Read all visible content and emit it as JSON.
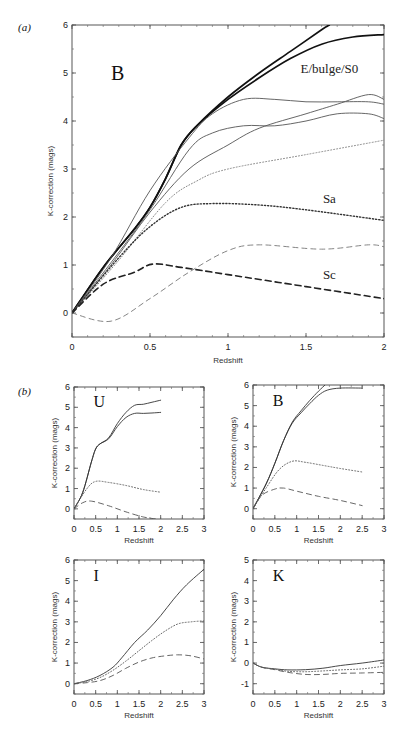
{
  "figure": {
    "panel_a_label": "(a)",
    "panel_b_label": "(b)"
  },
  "chart_data": [
    {
      "type": "line",
      "panel": "(a)",
      "band": "B",
      "xlabel": "Redshift",
      "ylabel": "K-correction (mags)",
      "xlim": [
        0,
        2
      ],
      "ylim": [
        -0.5,
        6
      ],
      "xticks": [
        "0",
        "0.5",
        "1",
        "1.5",
        "2"
      ],
      "yticks": [
        "0",
        "1",
        "2",
        "3",
        "4",
        "5",
        "6"
      ],
      "annotations": [
        "E/bulge/S0",
        "Sa",
        "Sc"
      ],
      "series": [
        {
          "name": "E/bulge/S0 (1)",
          "style": "thick-solid",
          "x": [
            0,
            0.2,
            0.4,
            0.5,
            0.6,
            0.7,
            0.8,
            1.0,
            1.2,
            1.4,
            1.6,
            1.65
          ],
          "y": [
            0,
            0.95,
            1.75,
            2.2,
            2.8,
            3.5,
            3.9,
            4.5,
            5.0,
            5.45,
            5.9,
            6.0
          ]
        },
        {
          "name": "E/bulge/S0 (2)",
          "style": "thick-solid",
          "x": [
            0,
            0.2,
            0.4,
            0.5,
            0.6,
            0.7,
            0.8,
            1.0,
            1.2,
            1.4,
            1.6,
            1.8,
            2.0
          ],
          "y": [
            0,
            0.95,
            1.75,
            2.2,
            2.8,
            3.5,
            3.9,
            4.45,
            4.9,
            5.3,
            5.6,
            5.75,
            5.8
          ]
        },
        {
          "name": "thin solid A",
          "style": "thin-solid",
          "x": [
            0,
            0.25,
            0.5,
            0.75,
            0.9,
            1.1,
            1.3,
            1.5,
            1.7,
            1.9,
            2.0
          ],
          "y": [
            0,
            1.15,
            2.55,
            3.65,
            4.15,
            4.45,
            4.45,
            4.4,
            4.4,
            4.4,
            4.35
          ]
        },
        {
          "name": "thin solid B",
          "style": "thin-solid",
          "x": [
            0,
            0.25,
            0.5,
            0.75,
            0.9,
            1.1,
            1.3,
            1.5,
            1.7,
            1.9,
            2.0
          ],
          "y": [
            0,
            1.05,
            2.15,
            3.4,
            3.75,
            3.9,
            3.9,
            4.0,
            4.15,
            4.15,
            4.05
          ]
        },
        {
          "name": "thin solid C",
          "style": "thin-solid",
          "x": [
            0,
            0.25,
            0.5,
            0.75,
            1.0,
            1.2,
            1.5,
            1.7,
            1.9,
            2.0
          ],
          "y": [
            0,
            1.0,
            2.1,
            3.0,
            3.5,
            3.85,
            4.15,
            4.35,
            4.55,
            4.45
          ]
        },
        {
          "name": "Sa (1)",
          "style": "light-dotted",
          "x": [
            0,
            0.3,
            0.6,
            0.8,
            1.0,
            1.5,
            2.0
          ],
          "y": [
            0,
            1.1,
            2.3,
            2.75,
            3.0,
            3.3,
            3.6
          ]
        },
        {
          "name": "Sa (2)",
          "style": "dark-dotted",
          "x": [
            0,
            0.3,
            0.5,
            0.7,
            0.9,
            1.2,
            1.5,
            2.0
          ],
          "y": [
            0,
            1.15,
            1.8,
            2.2,
            2.28,
            2.25,
            2.15,
            1.93
          ]
        },
        {
          "name": "Sc (1)",
          "style": "thick-dashed",
          "x": [
            0,
            0.2,
            0.4,
            0.52,
            0.7,
            1.0,
            1.5,
            2.0
          ],
          "y": [
            0,
            0.6,
            0.85,
            1.02,
            0.95,
            0.8,
            0.55,
            0.3
          ]
        },
        {
          "name": "Sc (2)",
          "style": "thin-dashed",
          "x": [
            0,
            0.25,
            0.5,
            0.75,
            1.0,
            1.2,
            1.6,
            1.9,
            2.0
          ],
          "y": [
            0,
            -0.17,
            0.3,
            0.85,
            1.3,
            1.42,
            1.33,
            1.42,
            1.38
          ]
        }
      ]
    },
    {
      "type": "line",
      "panel": "(b)",
      "band": "U",
      "xlabel": "Redshift",
      "ylabel": "K-correction (mags)",
      "xlim": [
        0,
        3
      ],
      "ylim": [
        -0.5,
        6
      ],
      "xticks": [
        "0",
        "0.5",
        "1",
        "1.5",
        "2",
        "2.5",
        "3"
      ],
      "yticks": [
        "0",
        "1",
        "2",
        "3",
        "4",
        "5",
        "6"
      ],
      "series": [
        {
          "name": "E (1)",
          "style": "solid",
          "x": [
            0,
            0.2,
            0.4,
            0.5,
            0.6,
            0.8,
            1.0,
            1.2,
            1.4,
            1.6,
            1.8,
            2.0
          ],
          "y": [
            0,
            0.8,
            2.3,
            2.95,
            3.2,
            3.5,
            4.2,
            4.75,
            5.1,
            5.15,
            5.25,
            5.35
          ]
        },
        {
          "name": "E (2)",
          "style": "solid",
          "x": [
            0,
            0.2,
            0.4,
            0.5,
            0.6,
            0.8,
            1.0,
            1.2,
            1.4,
            1.6,
            1.8,
            2.0
          ],
          "y": [
            0,
            0.8,
            2.3,
            2.95,
            3.2,
            3.45,
            4.05,
            4.5,
            4.7,
            4.7,
            4.72,
            4.75
          ]
        },
        {
          "name": "Sa",
          "style": "dotted",
          "x": [
            0,
            0.3,
            0.5,
            0.8,
            1.2,
            1.6,
            2.0
          ],
          "y": [
            0,
            1.0,
            1.35,
            1.3,
            1.15,
            0.95,
            0.82
          ]
        },
        {
          "name": "Sc",
          "style": "dashed",
          "x": [
            0,
            0.2,
            0.4,
            0.8,
            1.2,
            1.6,
            1.9
          ],
          "y": [
            0,
            0.3,
            0.38,
            0.15,
            -0.15,
            -0.4,
            -0.5
          ]
        }
      ]
    },
    {
      "type": "line",
      "panel": "(b)",
      "band": "B",
      "xlabel": "Redshift",
      "ylabel": "K-correction (mags)",
      "xlim": [
        0,
        3
      ],
      "ylim": [
        -0.5,
        6
      ],
      "xticks": [
        "0",
        "0.5",
        "1",
        "1.5",
        "2",
        "2.5",
        "3"
      ],
      "yticks": [
        "0",
        "1",
        "2",
        "3",
        "4",
        "5",
        "6"
      ],
      "series": [
        {
          "name": "E (1)",
          "style": "solid",
          "x": [
            0,
            0.3,
            0.5,
            0.7,
            0.9,
            1.1,
            1.3,
            1.5,
            1.65
          ],
          "y": [
            0,
            1.2,
            2.2,
            3.3,
            4.2,
            4.75,
            5.25,
            5.7,
            6.0
          ]
        },
        {
          "name": "E (2)",
          "style": "solid",
          "x": [
            0,
            0.3,
            0.5,
            0.7,
            0.9,
            1.1,
            1.3,
            1.5,
            1.7,
            2.0,
            2.5
          ],
          "y": [
            0,
            1.2,
            2.2,
            3.3,
            4.15,
            4.65,
            5.1,
            5.5,
            5.75,
            5.85,
            5.85
          ]
        },
        {
          "name": "Sa",
          "style": "dotted",
          "x": [
            0,
            0.3,
            0.6,
            0.9,
            1.2,
            1.6,
            2.0,
            2.5
          ],
          "y": [
            0,
            1.0,
            1.9,
            2.3,
            2.25,
            2.1,
            1.95,
            1.78
          ]
        },
        {
          "name": "Sc",
          "style": "dashed",
          "x": [
            0,
            0.2,
            0.5,
            0.7,
            1.0,
            1.5,
            2.0,
            2.5
          ],
          "y": [
            0,
            0.65,
            0.95,
            1.0,
            0.85,
            0.6,
            0.4,
            0.15
          ]
        }
      ]
    },
    {
      "type": "line",
      "panel": "(b)",
      "band": "I",
      "xlabel": "Redshift",
      "ylabel": "K-correction (mags)",
      "xlim": [
        0,
        3
      ],
      "ylim": [
        -0.5,
        6
      ],
      "xticks": [
        "0",
        "0.5",
        "1",
        "1.5",
        "2",
        "2.5",
        "3"
      ],
      "yticks": [
        "0",
        "1",
        "2",
        "3",
        "4",
        "5",
        "6"
      ],
      "series": [
        {
          "name": "E",
          "style": "solid",
          "x": [
            0,
            0.3,
            0.6,
            0.9,
            1.1,
            1.4,
            1.7,
            2.0,
            2.3,
            2.6,
            3.0
          ],
          "y": [
            0,
            0.15,
            0.4,
            0.8,
            1.25,
            2.0,
            2.6,
            3.3,
            4.1,
            4.8,
            5.55
          ]
        },
        {
          "name": "Sa",
          "style": "dotted",
          "x": [
            0,
            0.3,
            0.6,
            0.9,
            1.2,
            1.5,
            1.8,
            2.1,
            2.4,
            2.7,
            3.0
          ],
          "y": [
            0,
            0.1,
            0.3,
            0.65,
            1.1,
            1.6,
            2.1,
            2.55,
            2.9,
            3.0,
            3.05
          ]
        },
        {
          "name": "Sc",
          "style": "dashed",
          "x": [
            0,
            0.3,
            0.6,
            0.9,
            1.2,
            1.5,
            1.8,
            2.1,
            2.4,
            2.7,
            3.0
          ],
          "y": [
            0,
            0.05,
            0.15,
            0.4,
            0.75,
            1.05,
            1.25,
            1.35,
            1.4,
            1.35,
            1.2
          ]
        }
      ]
    },
    {
      "type": "line",
      "panel": "(b)",
      "band": "K",
      "xlabel": "Redshift",
      "ylabel": "K-correction (mags)",
      "xlim": [
        0,
        3
      ],
      "ylim": [
        -1.5,
        5
      ],
      "xticks": [
        "0",
        "0.5",
        "1",
        "1.5",
        "2",
        "2.5",
        "3"
      ],
      "yticks": [
        "-1",
        "0",
        "1",
        "2",
        "3",
        "4",
        "5"
      ],
      "series": [
        {
          "name": "E",
          "style": "solid",
          "x": [
            0,
            0.2,
            0.5,
            0.8,
            1.2,
            1.6,
            2.0,
            2.5,
            3.0
          ],
          "y": [
            0,
            -0.2,
            -0.28,
            -0.33,
            -0.32,
            -0.25,
            -0.12,
            0.0,
            0.15
          ]
        },
        {
          "name": "Sa",
          "style": "dotted",
          "x": [
            0,
            0.2,
            0.5,
            0.8,
            1.2,
            1.6,
            2.0,
            2.5,
            3.0
          ],
          "y": [
            0,
            -0.2,
            -0.3,
            -0.4,
            -0.42,
            -0.38,
            -0.33,
            -0.28,
            -0.15
          ]
        },
        {
          "name": "Sc",
          "style": "dashed",
          "x": [
            0,
            0.2,
            0.5,
            0.8,
            1.2,
            1.6,
            2.0,
            2.5,
            3.0
          ],
          "y": [
            0,
            -0.2,
            -0.32,
            -0.45,
            -0.55,
            -0.55,
            -0.5,
            -0.48,
            -0.45
          ]
        }
      ]
    }
  ]
}
